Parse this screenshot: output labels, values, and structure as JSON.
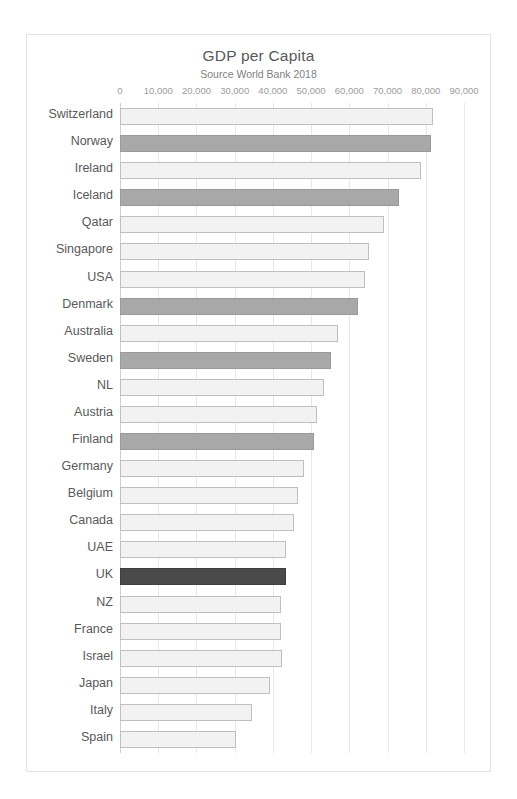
{
  "chart_data": {
    "type": "bar",
    "orientation": "horizontal",
    "title": "GDP per Capita",
    "subtitle": "Source World Bank 2018",
    "xlabel": "",
    "ylabel": "",
    "xlim": [
      0,
      90000
    ],
    "xticks": [
      0,
      10000,
      20000,
      30000,
      40000,
      50000,
      60000,
      70000,
      80000,
      90000
    ],
    "xtick_labels": [
      "0",
      "10,000",
      "20,000",
      "30,000",
      "40,000",
      "50,000",
      "60,000",
      "70,000",
      "80,000",
      "90,000"
    ],
    "grid": "vertical",
    "legend": "none",
    "categories": [
      "Switzerland",
      "Norway",
      "Ireland",
      "Iceland",
      "Qatar",
      "Singapore",
      "USA",
      "Denmark",
      "Australia",
      "Sweden",
      "NL",
      "Austria",
      "Finland",
      "Germany",
      "Belgium",
      "Canada",
      "UAE",
      "UK",
      "NZ",
      "France",
      "Israel",
      "Japan",
      "Italy",
      "Spain"
    ],
    "values": [
      82000,
      81300,
      78700,
      73000,
      69000,
      65200,
      64000,
      62300,
      57000,
      55200,
      53400,
      51600,
      50800,
      48200,
      46600,
      45600,
      43500,
      43300,
      42000,
      42000,
      42500,
      39300,
      34500,
      30300
    ],
    "bar_styles": [
      "light",
      "grey",
      "light",
      "grey",
      "light",
      "light",
      "light",
      "grey",
      "light",
      "grey",
      "light",
      "light",
      "grey",
      "light",
      "light",
      "light",
      "light",
      "dark",
      "light",
      "light",
      "light",
      "light",
      "light",
      "light"
    ],
    "colors": {
      "light_fill": "#f2f2f2",
      "light_border": "#bfbfbf",
      "grey_fill": "#a8a8a8",
      "dark_fill": "#4a4a4a",
      "gridline": "#e8e8e8",
      "text": "#595959",
      "tick_text": "#9c9c9c",
      "frame_border": "#e3e3e3",
      "background": "#ffffff"
    }
  }
}
